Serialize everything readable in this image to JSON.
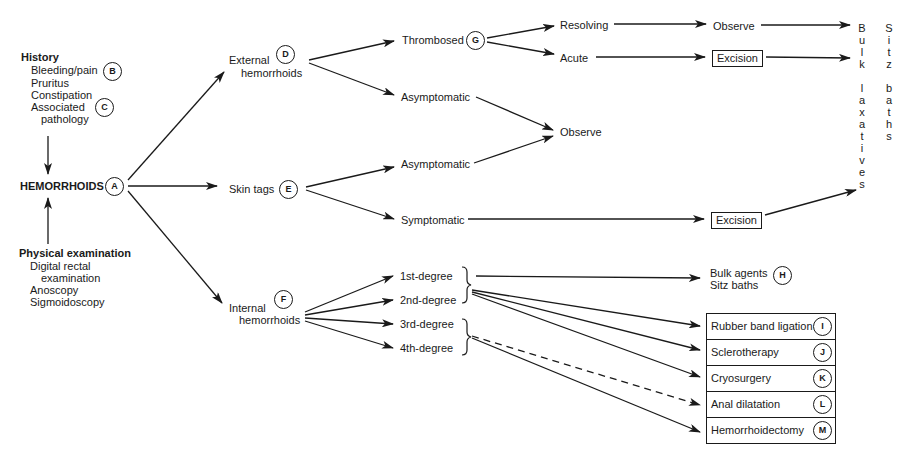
{
  "diagram": {
    "type": "clinical-decision-flowchart",
    "root": {
      "label": "HEMORRHOIDS",
      "marker": "A"
    },
    "history": {
      "title": "History",
      "items": [
        "Bleeding/pain",
        "Pruritus",
        "Constipation",
        "Associated",
        "pathology"
      ],
      "markers": {
        "bleeding": "B",
        "associated": "C"
      }
    },
    "physical_exam": {
      "title": "Physical examination",
      "items": [
        "Digital rectal",
        "examination",
        "Anoscopy",
        "Sigmoidoscopy"
      ]
    },
    "external": {
      "label_line1": "External",
      "label_line2": "hemorrhoids",
      "marker": "D",
      "thrombosed": {
        "label": "Thrombosed",
        "marker": "G"
      },
      "resolving": "Resolving",
      "acute": "Acute",
      "observe_resolving": "Observe",
      "excision_acute": "Excision",
      "asymptomatic": "Asymptomatic"
    },
    "skin_tags": {
      "label": "Skin tags",
      "marker": "E",
      "asymptomatic": "Asymptomatic",
      "symptomatic": "Symptomatic",
      "excision": "Excision"
    },
    "observe_shared": "Observe",
    "final_column": {
      "bulk_laxatives": [
        "B",
        "u",
        "l",
        "k",
        "",
        "l",
        "a",
        "x",
        "a",
        "t",
        "i",
        "v",
        "e",
        "s"
      ],
      "sitz_baths": [
        "S",
        "i",
        "t",
        "z",
        "",
        "b",
        "a",
        "t",
        "h",
        "s"
      ]
    },
    "internal": {
      "label_line1": "Internal",
      "label_line2": "hemorrhoids",
      "marker": "F",
      "degrees": [
        "1st-degree",
        "2nd-degree",
        "3rd-degree",
        "4th-degree"
      ],
      "conservative": {
        "line1": "Bulk agents",
        "line2": "Sitz baths",
        "marker": "H"
      },
      "treatments": [
        {
          "label": "Rubber band ligation",
          "marker": "I"
        },
        {
          "label": "Sclerotherapy",
          "marker": "J"
        },
        {
          "label": "Cryosurgery",
          "marker": "K"
        },
        {
          "label": "Anal dilatation",
          "marker": "L"
        },
        {
          "label": "Hemorrhoidectomy",
          "marker": "M"
        }
      ]
    }
  }
}
